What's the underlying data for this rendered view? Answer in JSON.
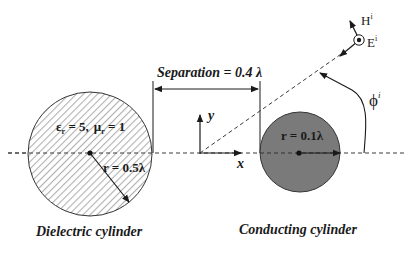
{
  "diagram": {
    "separation_label": "Separation = 0.4 λ",
    "axes": {
      "x_label": "x",
      "y_label": "y"
    },
    "dielectric": {
      "material_label": "εr = 5,  μr = 1",
      "eps_symbol": "ε",
      "eps_sub": "r",
      "eps_value": " = 5,",
      "mu_symbol": "μ",
      "mu_sub": "r",
      "mu_value": " = 1",
      "radius_label": "r = 0.5λ",
      "caption": "Dielectric cylinder",
      "fill_color": "#ffffff",
      "hatch_color": "#b5b5b5"
    },
    "conductor": {
      "radius_label": "r = 0.1λ",
      "caption": "Conducting cylinder",
      "fill_color": "#7a7a7a"
    },
    "incident_wave": {
      "h_label": "H",
      "h_sup": "i",
      "e_label": "E",
      "e_sup": "i",
      "angle_label": "ϕ",
      "angle_sup": "i"
    },
    "colors": {
      "line": "#1a1a1a",
      "dashed": "#3a3a3a"
    }
  }
}
